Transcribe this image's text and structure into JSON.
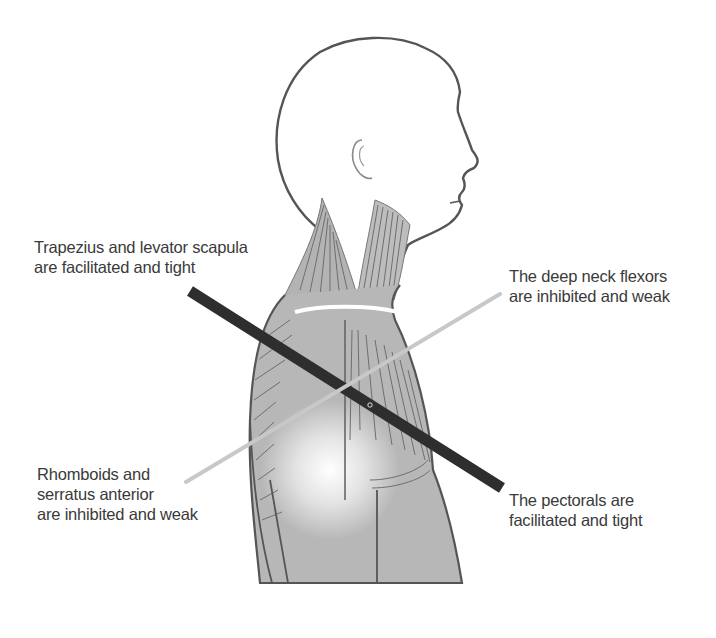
{
  "diagram": {
    "type": "anatomical-illustration",
    "labels": {
      "upper_left": {
        "lines": [
          "Trapezius and levator scapula",
          "are facilitated and tight"
        ]
      },
      "upper_right": {
        "lines": [
          "The deep neck flexors",
          "are inhibited and weak"
        ]
      },
      "lower_left": {
        "lines": [
          "Rhomboids and",
          "serratus anterior",
          "are inhibited and weak"
        ]
      },
      "lower_right": {
        "lines": [
          "The pectorals are",
          "facilitated and tight"
        ]
      }
    },
    "lines": [
      {
        "name": "facilitated-tight-axis",
        "from": [
          190,
          291
        ],
        "to": [
          502,
          488
        ],
        "color": "#2e2e2e",
        "width": 11
      },
      {
        "name": "inhibited-weak-axis",
        "from": [
          186,
          482
        ],
        "to": [
          500,
          294
        ],
        "color": "#c8c8c8",
        "width": 4
      }
    ],
    "colors": {
      "outline": "#555555",
      "muscle_fill": "#a9a9a9",
      "muscle_stroke": "#6e6e6e",
      "body_fill": "#b7b7b7",
      "text": "#3a3a3a",
      "background": "#ffffff"
    }
  }
}
